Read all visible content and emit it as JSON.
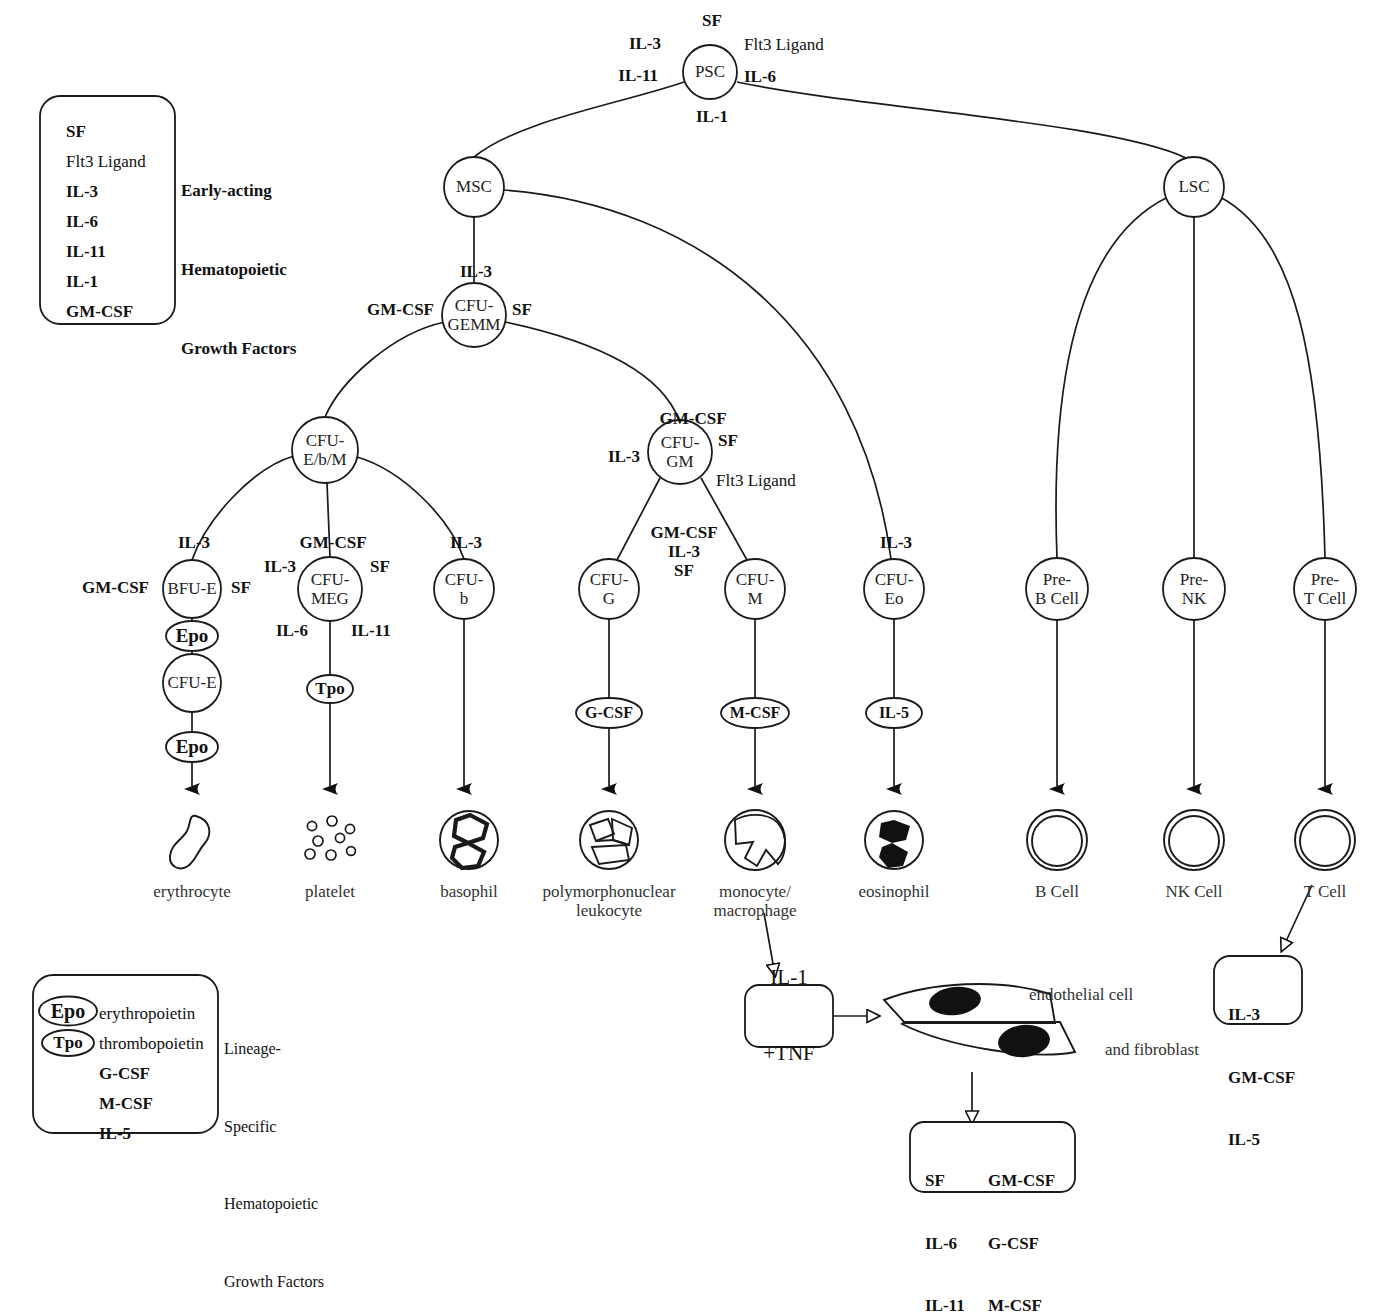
{
  "legend_early": {
    "items": [
      {
        "text": "SF",
        "bold": true
      },
      {
        "text": "Flt3 Ligand",
        "bold": false
      },
      {
        "text": "IL-3",
        "bold": true
      },
      {
        "text": "IL-6",
        "bold": true
      },
      {
        "text": "IL-11",
        "bold": true
      },
      {
        "text": "IL-1",
        "bold": true
      },
      {
        "text": "GM-CSF",
        "bold": true
      }
    ],
    "description": [
      "Early-acting",
      "Hematopoietic",
      "Growth Factors"
    ]
  },
  "legend_lineage": {
    "items": [
      {
        "badge": "Epo",
        "badge_shape": "ellipse",
        "text": "erythropoietin"
      },
      {
        "badge": "Tpo",
        "badge_shape": "ellipse",
        "text": "thrombopoietin"
      },
      {
        "badge": "",
        "badge_shape": "none",
        "text": "G-CSF"
      },
      {
        "badge": "",
        "badge_shape": "none",
        "text": "M-CSF"
      },
      {
        "badge": "",
        "badge_shape": "none",
        "text": "IL-5"
      }
    ],
    "description": [
      "Lineage-",
      "Specific",
      "Hematopoietic",
      "Growth Factors"
    ]
  },
  "nodes": {
    "psc": {
      "label": "PSC",
      "x": 710,
      "y": 72,
      "r": 27
    },
    "msc": {
      "label": "MSC",
      "x": 474,
      "y": 187,
      "r": 30
    },
    "lsc": {
      "label": "LSC",
      "x": 1194,
      "y": 187,
      "r": 30
    },
    "cfu_gemm": {
      "label": "CFU-\nGEMM",
      "x": 474,
      "y": 315,
      "r": 32
    },
    "cfu_ebm": {
      "label": "CFU-\nE/b/M",
      "x": 325,
      "y": 450,
      "r": 33
    },
    "cfu_gm": {
      "label": "CFU-\nGM",
      "x": 680,
      "y": 452,
      "r": 32
    },
    "bfu_e": {
      "label": "BFU-E",
      "x": 192,
      "y": 589,
      "r": 29
    },
    "cfu_meg": {
      "label": "CFU-\nMEG",
      "x": 330,
      "y": 589,
      "r": 32
    },
    "cfu_b": {
      "label": "CFU-\nb",
      "x": 464,
      "y": 589,
      "r": 30
    },
    "cfu_g": {
      "label": "CFU-\nG",
      "x": 609,
      "y": 589,
      "r": 30
    },
    "cfu_m": {
      "label": "CFU-\nM",
      "x": 755,
      "y": 589,
      "r": 30
    },
    "cfu_eo": {
      "label": "CFU-\nEo",
      "x": 894,
      "y": 589,
      "r": 30
    },
    "pre_b": {
      "label": "Pre-\nB Cell",
      "x": 1057,
      "y": 589,
      "r": 31
    },
    "pre_nk": {
      "label": "Pre-\nNK",
      "x": 1194,
      "y": 589,
      "r": 31
    },
    "pre_t": {
      "label": "Pre-\nT Cell",
      "x": 1325,
      "y": 589,
      "r": 31
    },
    "cfu_e": {
      "label": "CFU-E",
      "x": 192,
      "y": 683,
      "r": 29
    }
  },
  "growth_badges": [
    {
      "label": "Epo",
      "x": 192,
      "y": 636,
      "rx": 26,
      "ry": 15,
      "size": 19
    },
    {
      "label": "Epo",
      "x": 192,
      "y": 747,
      "rx": 26,
      "ry": 15,
      "size": 19
    },
    {
      "label": "Tpo",
      "x": 330,
      "y": 689,
      "rx": 23,
      "ry": 14,
      "size": 17
    },
    {
      "label": "G-CSF",
      "x": 609,
      "y": 713,
      "rx": 33,
      "ry": 15,
      "size": 16
    },
    {
      "label": "M-CSF",
      "x": 755,
      "y": 713,
      "rx": 34,
      "ry": 15,
      "size": 16
    },
    {
      "label": "IL-5",
      "x": 894,
      "y": 713,
      "rx": 28,
      "ry": 15,
      "size": 16
    }
  ],
  "factor_labels": [
    {
      "text": "SF",
      "x": 712,
      "y": 21,
      "bold": true,
      "align": "center"
    },
    {
      "text": "IL-3",
      "x": 661,
      "y": 44,
      "bold": true,
      "align": "right"
    },
    {
      "text": "Flt3 Ligand",
      "x": 744,
      "y": 45,
      "bold": false,
      "align": "left"
    },
    {
      "text": "IL-11",
      "x": 658,
      "y": 76,
      "bold": true,
      "align": "right"
    },
    {
      "text": "IL-6",
      "x": 744,
      "y": 77,
      "bold": true,
      "align": "left"
    },
    {
      "text": "IL-1",
      "x": 712,
      "y": 117,
      "bold": true,
      "align": "center"
    },
    {
      "text": "IL-3",
      "x": 476,
      "y": 272,
      "bold": true,
      "align": "center"
    },
    {
      "text": "GM-CSF",
      "x": 434,
      "y": 310,
      "bold": true,
      "align": "right"
    },
    {
      "text": "SF",
      "x": 512,
      "y": 310,
      "bold": true,
      "align": "left"
    },
    {
      "text": "GM-CSF",
      "x": 693,
      "y": 419,
      "bold": true,
      "align": "center"
    },
    {
      "text": "IL-3",
      "x": 640,
      "y": 457,
      "bold": true,
      "align": "right"
    },
    {
      "text": "SF",
      "x": 718,
      "y": 441,
      "bold": true,
      "align": "left"
    },
    {
      "text": "Flt3 Ligand",
      "x": 716,
      "y": 481,
      "bold": false,
      "align": "left"
    },
    {
      "text": "IL-3",
      "x": 194,
      "y": 543,
      "bold": true,
      "align": "center"
    },
    {
      "text": "GM-CSF",
      "x": 149,
      "y": 588,
      "bold": true,
      "align": "right"
    },
    {
      "text": "SF",
      "x": 231,
      "y": 588,
      "bold": true,
      "align": "left"
    },
    {
      "text": "GM-CSF",
      "x": 333,
      "y": 543,
      "bold": true,
      "align": "center"
    },
    {
      "text": "IL-3",
      "x": 296,
      "y": 567,
      "bold": true,
      "align": "right"
    },
    {
      "text": "SF",
      "x": 370,
      "y": 567,
      "bold": true,
      "align": "left"
    },
    {
      "text": "IL-6",
      "x": 308,
      "y": 631,
      "bold": true,
      "align": "right"
    },
    {
      "text": "IL-11",
      "x": 351,
      "y": 631,
      "bold": true,
      "align": "left"
    },
    {
      "text": "IL-3",
      "x": 466,
      "y": 543,
      "bold": true,
      "align": "center"
    },
    {
      "text": "IL-3",
      "x": 896,
      "y": 543,
      "bold": true,
      "align": "center"
    }
  ],
  "stacked_factor": {
    "lines": [
      "GM-CSF",
      "IL-3",
      "SF"
    ],
    "x": 684,
    "y": 552
  },
  "terminal_cells": [
    {
      "label": "erythrocyte",
      "x": 192,
      "y": 852,
      "icon": "erythrocyte"
    },
    {
      "label": "platelet",
      "x": 330,
      "y": 852,
      "icon": "platelet"
    },
    {
      "label": "basophil",
      "x": 469,
      "y": 852,
      "icon": "basophil"
    },
    {
      "label": "polymorphonuclear\nleukocyte",
      "x": 609,
      "y": 852,
      "icon": "pmn"
    },
    {
      "label": "monocyte/\nmacrophage",
      "x": 755,
      "y": 852,
      "icon": "monocyte"
    },
    {
      "label": "eosinophil",
      "x": 894,
      "y": 852,
      "icon": "eosinophil"
    },
    {
      "label": "B Cell",
      "x": 1057,
      "y": 852,
      "icon": "lymphocyte"
    },
    {
      "label": "NK Cell",
      "x": 1194,
      "y": 852,
      "icon": "lymphocyte"
    },
    {
      "label": "T Cell",
      "x": 1325,
      "y": 852,
      "icon": "lymphocyte"
    }
  ],
  "tcell_box": {
    "lines": [
      "IL-3",
      "GM-CSF",
      "IL-5"
    ],
    "x": 1250,
    "y": 990
  },
  "il1_tnf_box": {
    "lines": [
      "IL-1",
      "+TNF"
    ],
    "x": 789,
    "y": 1010
  },
  "stroma": {
    "endothelial_label": "endothelial cell",
    "fibroblast_label": "and fibroblast",
    "endothelial_x": 1029,
    "endothelial_y": 995,
    "fibroblast_x": 1105,
    "fibroblast_y": 1050
  },
  "stroma_output_box": {
    "col1": [
      "SF",
      "IL-6",
      "IL-11"
    ],
    "col2": [
      "GM-CSF",
      "G-CSF",
      "M-CSF"
    ],
    "x": 992,
    "y": 1152
  },
  "colors": {
    "line": "#1a1a1a",
    "text": "#111111",
    "fill": "#ffffff"
  }
}
